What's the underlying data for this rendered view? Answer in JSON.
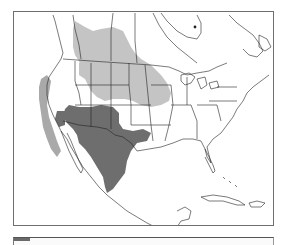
{
  "map": {
    "region": "North America",
    "legend": [
      {
        "label": "range-a",
        "color": "#c4c4c4"
      },
      {
        "label": "range-b",
        "color": "#6e6e6e"
      }
    ],
    "colors": {
      "background": "#ffffff",
      "border_lines": "#222222",
      "light_range": "#c4c4c4",
      "dark_range": "#6e6e6e",
      "frame": "#6e6e6e"
    }
  }
}
